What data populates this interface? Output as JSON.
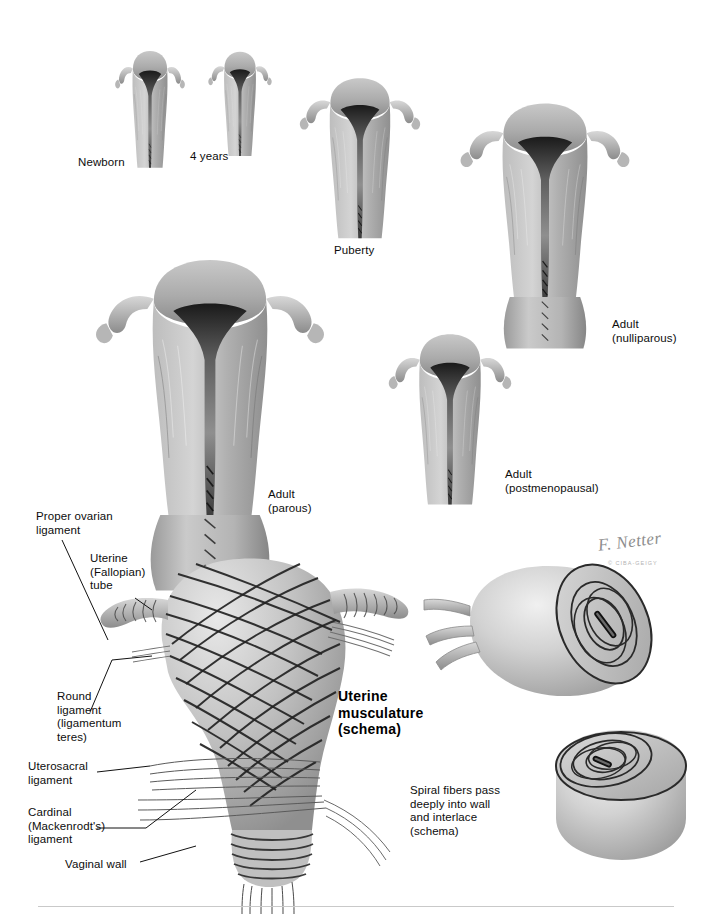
{
  "plate": {
    "title": "Uterus development and musculature plate",
    "signature": "F. Netter",
    "signature_sub": "© CIBA-GEIGY",
    "background_color": "#ffffff",
    "ink_color": "#111111"
  },
  "stages": [
    {
      "id": "newborn",
      "label": "Newborn",
      "x": 108,
      "y": 156,
      "align": "center"
    },
    {
      "id": "four-years",
      "label": "4 years",
      "x": 218,
      "y": 150,
      "align": "center"
    },
    {
      "id": "puberty",
      "label": "Puberty",
      "x": 360,
      "y": 244,
      "align": "center"
    },
    {
      "id": "adult-nulliparous",
      "label": "Adult\n(nulliparous)",
      "x": 612,
      "y": 318,
      "align": "left"
    },
    {
      "id": "adult-parous",
      "label": "Adult\n(parous)",
      "x": 268,
      "y": 488,
      "align": "left"
    },
    {
      "id": "adult-postmenopausal",
      "label": "Adult\n(postmenopausal)",
      "x": 505,
      "y": 468,
      "align": "left"
    }
  ],
  "schema": {
    "heading": "Uterine\nmusculature\n(schema)",
    "heading_x": 338,
    "heading_y": 688,
    "caption": "Spiral fibers pass\ndeeply into wall\nand interlace\n(schema)",
    "caption_x": 410,
    "caption_y": 784
  },
  "callouts": [
    {
      "id": "proper-ovarian-ligament",
      "label": "Proper ovarian\nligament",
      "x": 36,
      "y": 510
    },
    {
      "id": "uterine-fallopian-tube",
      "label": "Uterine\n(Fallopian)\ntube",
      "x": 90,
      "y": 552
    },
    {
      "id": "round-ligament",
      "label": "Round\nligament\n(ligamentum\nteres)",
      "x": 57,
      "y": 690
    },
    {
      "id": "uterosacral-ligament",
      "label": "Uterosacral\nligament",
      "x": 28,
      "y": 760
    },
    {
      "id": "cardinal-ligament",
      "label": "Cardinal\n(Mackenrodt's)\nligament",
      "x": 28,
      "y": 806
    },
    {
      "id": "vaginal-wall",
      "label": "Vaginal wall",
      "x": 65,
      "y": 858
    }
  ],
  "colors": {
    "tissue_light": "#cfcfcf",
    "tissue_mid": "#a8a8a8",
    "tissue_dark": "#6f6f6f",
    "cavity_black": "#151515",
    "cavity_grey": "#8a8a8a",
    "fiber_dark": "#2b2b2b",
    "fiber_mid": "#6e6e6e",
    "rule": "#c9c9c9"
  }
}
